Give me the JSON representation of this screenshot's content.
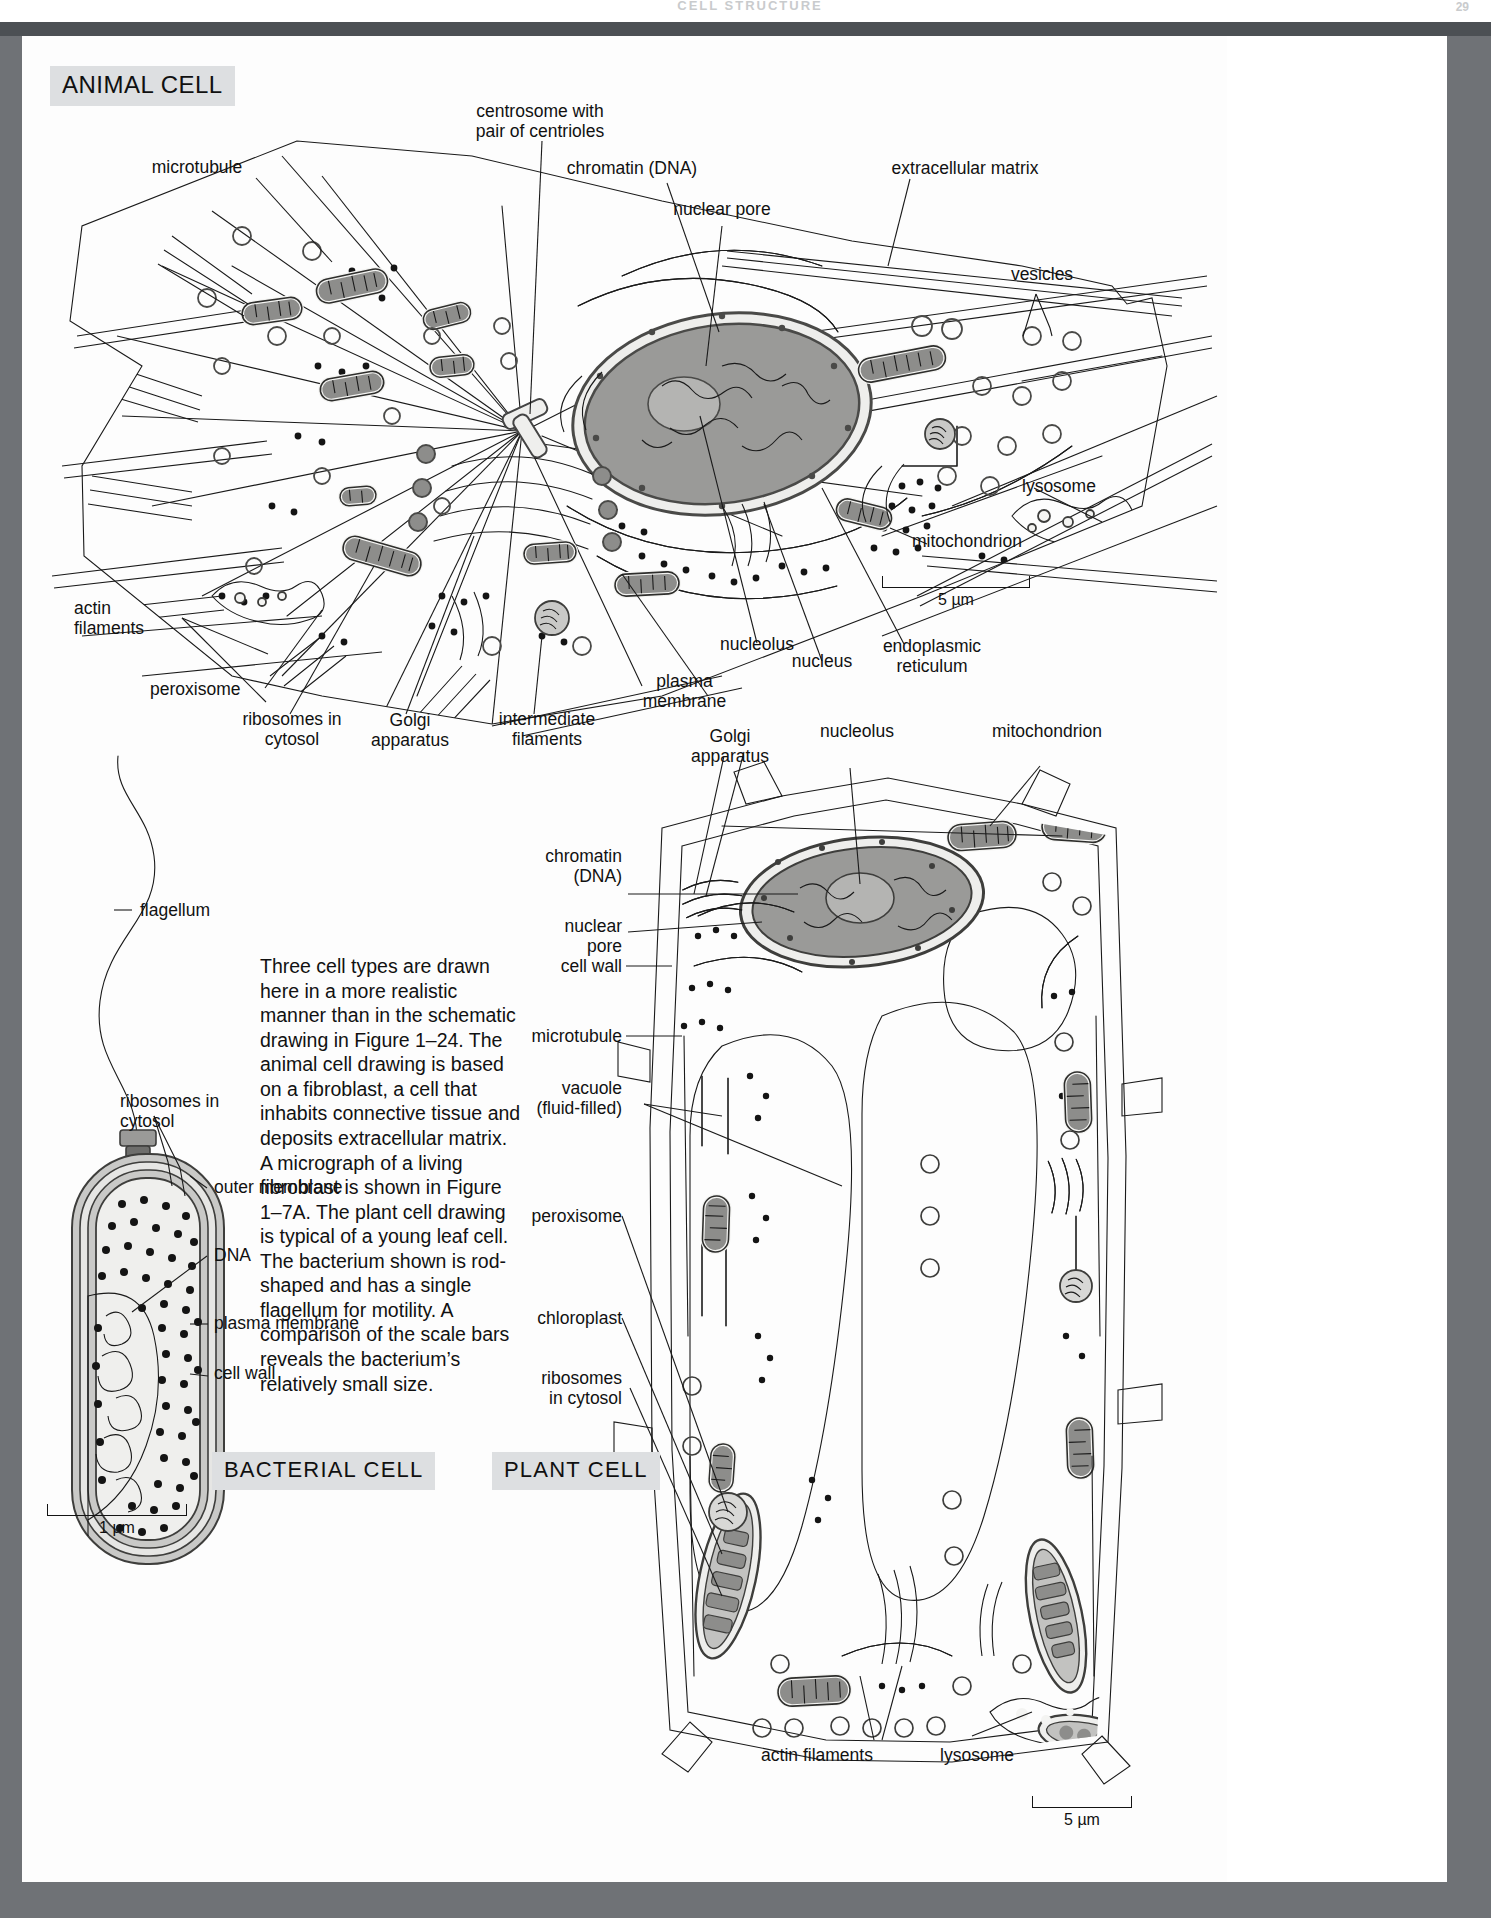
{
  "page": {
    "running_head": "CELL STRUCTURE",
    "folio": "29",
    "frame_color": "#6f7276"
  },
  "sections": {
    "animal": {
      "tag": "ANIMAL CELL"
    },
    "bacterial": {
      "tag": "BACTERIAL  CELL"
    },
    "plant": {
      "tag": "PLANT  CELL"
    }
  },
  "caption": {
    "text": "Three cell types are drawn here in a more realistic manner than in the schematic drawing in Figure 1–24. The animal cell drawing is based on a fibroblast, a cell that inhabits connective tissue and deposits extracellular matrix. A micrograph of a living fibroblast is shown in Figure 1–7A. The plant cell drawing is typical of a young leaf cell. The bacterium shown is rod-shaped and has a single flagellum for motility. A comparison of the scale bars reveals the bacterium’s relatively small size."
  },
  "animal_labels": [
    {
      "id": "microtubule",
      "text": "microtubule"
    },
    {
      "id": "centrosome",
      "text": "centrosome with\npair of centrioles"
    },
    {
      "id": "chromatin",
      "text": "chromatin (DNA)"
    },
    {
      "id": "nuclear-pore",
      "text": "nuclear pore"
    },
    {
      "id": "extracellular-matrix",
      "text": "extracellular matrix"
    },
    {
      "id": "vesicles",
      "text": "vesicles"
    },
    {
      "id": "lysosome",
      "text": "lysosome"
    },
    {
      "id": "mitochondrion",
      "text": "mitochondrion"
    },
    {
      "id": "endoplasmic-reticulum",
      "text": "endoplasmic\nreticulum"
    },
    {
      "id": "nucleus",
      "text": "nucleus"
    },
    {
      "id": "nucleolus",
      "text": "nucleolus"
    },
    {
      "id": "plasma-membrane",
      "text": "plasma\nmembrane"
    },
    {
      "id": "intermediate-filaments",
      "text": "intermediate\nfilaments"
    },
    {
      "id": "golgi-apparatus",
      "text": "Golgi\napparatus"
    },
    {
      "id": "ribosomes",
      "text": "ribosomes in\ncytosol"
    },
    {
      "id": "peroxisome",
      "text": "peroxisome"
    },
    {
      "id": "actin-filaments",
      "text": "actin\nfilaments"
    }
  ],
  "bacterial_labels": [
    {
      "id": "flagellum",
      "text": "flagellum"
    },
    {
      "id": "ribosomes",
      "text": "ribosomes in\ncytosol"
    },
    {
      "id": "outer-membrane",
      "text": "outer membrane"
    },
    {
      "id": "dna",
      "text": "DNA"
    },
    {
      "id": "plasma-membrane",
      "text": "plasma membrane"
    },
    {
      "id": "cell-wall",
      "text": "cell wall"
    }
  ],
  "plant_labels": [
    {
      "id": "golgi-apparatus",
      "text": "Golgi\napparatus"
    },
    {
      "id": "nucleolus",
      "text": "nucleolus"
    },
    {
      "id": "mitochondrion",
      "text": "mitochondrion"
    },
    {
      "id": "chromatin",
      "text": "chromatin\n(DNA)"
    },
    {
      "id": "nuclear-pore",
      "text": "nuclear\npore"
    },
    {
      "id": "cell-wall",
      "text": "cell wall"
    },
    {
      "id": "microtubule",
      "text": "microtubule"
    },
    {
      "id": "vacuole",
      "text": "vacuole\n(fluid-filled)"
    },
    {
      "id": "peroxisome",
      "text": "peroxisome"
    },
    {
      "id": "chloroplast",
      "text": "chloroplast"
    },
    {
      "id": "ribosomes",
      "text": "ribosomes\nin cytosol"
    },
    {
      "id": "actin-filaments",
      "text": "actin filaments"
    },
    {
      "id": "lysosome",
      "text": "lysosome"
    }
  ],
  "scale_bars": [
    {
      "id": "animal-scale",
      "caption": "5 µm"
    },
    {
      "id": "bacterial-scale",
      "caption": "1 µm"
    },
    {
      "id": "plant-scale",
      "caption": "5 µm"
    }
  ],
  "colors": {
    "frame": "#6f7276",
    "dark_band": "#4c5054",
    "paper": "#ffffff",
    "cytosol": "#c6c6c4",
    "nucleoplasm": "#9a9a98",
    "organelle_dark": "#8d8d8b",
    "membrane_light": "#eeeeec",
    "tag_bg": "#dddfe1",
    "ink": "#1a1a1a"
  }
}
